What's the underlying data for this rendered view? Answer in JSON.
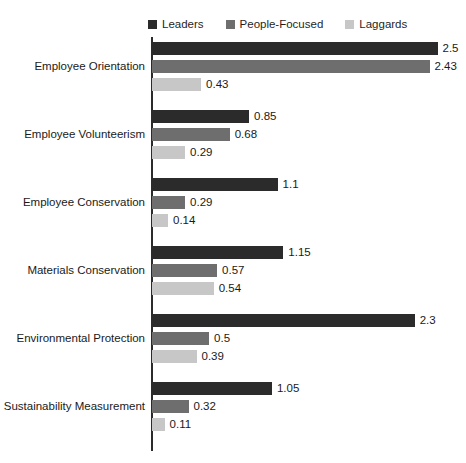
{
  "chart_data": {
    "type": "bar",
    "orientation": "horizontal",
    "title": "",
    "xlabel": "",
    "ylabel": "",
    "grid": false,
    "legend_position": "top",
    "xlim": [
      0,
      2.5
    ],
    "categories": [
      "Employee Orientation",
      "Employee Volunteerism",
      "Employee Conservation",
      "Materials Conservation",
      "Environmental Protection",
      "Sustainability Measurement"
    ],
    "series": [
      {
        "name": "Leaders",
        "color": "#2b2b2b",
        "values": [
          2.5,
          0.85,
          1.1,
          1.15,
          2.3,
          1.05
        ],
        "labels": [
          "2.5",
          "0.85",
          "1.1",
          "1.15",
          "2.3",
          "1.05"
        ]
      },
      {
        "name": "People-Focused",
        "color": "#6e6e6e",
        "values": [
          2.43,
          0.68,
          0.29,
          0.57,
          0.5,
          0.32
        ],
        "labels": [
          "2.43",
          "0.68",
          "0.29",
          "0.57",
          "0.5",
          "0.32"
        ]
      },
      {
        "name": "Laggards",
        "color": "#c7c7c7",
        "values": [
          0.43,
          0.29,
          0.14,
          0.54,
          0.39,
          0.11
        ],
        "labels": [
          "0.43",
          "0.29",
          "0.14",
          "0.54",
          "0.39",
          "0.11"
        ]
      }
    ]
  }
}
